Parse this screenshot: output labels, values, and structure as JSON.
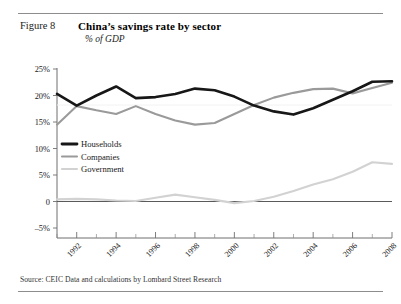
{
  "figure": {
    "label": "Figure 8",
    "title": "China’s savings rate by sector",
    "subtitle": "% of GDP",
    "source": "Source: CEIC Data and calculations by Lombard Street Research"
  },
  "colors": {
    "households": "#171717",
    "companies": "#9a9a9a",
    "government": "#d2d2d2",
    "axis": "#6f6f6f",
    "zero_line": "#5a5a5a",
    "rule": "#8d8d8d",
    "text": "#1a1a1a",
    "background": "#ffffff"
  },
  "chart_data": {
    "type": "line",
    "title": "China’s savings rate by sector",
    "subtitle": "% of GDP",
    "xlabel": "",
    "ylabel": "% of GDP",
    "ylim": [
      -5,
      25
    ],
    "xlim": [
      1991,
      2008
    ],
    "grid": false,
    "legend_position": "inside-left",
    "y_ticks": [
      25,
      20,
      15,
      10,
      5,
      0,
      -5
    ],
    "y_tick_labels": [
      "25%",
      "20%",
      "15%",
      "10%",
      "5%",
      "0",
      "–5%"
    ],
    "x_ticks": [
      1992,
      1994,
      1996,
      1998,
      2000,
      2002,
      2004,
      2006,
      2008
    ],
    "x_tick_labels": [
      "1992",
      "1994",
      "1996",
      "1998",
      "2000",
      "2002",
      "2004",
      "2006",
      "2008"
    ],
    "x_minor_ticks": [
      1991,
      1993,
      1995,
      1997,
      1999,
      2001,
      2003,
      2005,
      2007
    ],
    "x": [
      1991,
      1992,
      1993,
      1994,
      1995,
      1996,
      1997,
      1998,
      1999,
      2000,
      2001,
      2002,
      2003,
      2004,
      2005,
      2006,
      2007,
      2008
    ],
    "series": [
      {
        "name": "Households",
        "color": "#171717",
        "width": 2.6,
        "values": [
          20.3,
          18.1,
          20.0,
          21.7,
          19.5,
          19.7,
          20.3,
          21.3,
          21.0,
          19.8,
          18.1,
          17.0,
          16.4,
          17.6,
          19.2,
          20.8,
          22.6,
          22.7
        ]
      },
      {
        "name": "Companies",
        "color": "#9a9a9a",
        "width": 2.1,
        "values": [
          14.5,
          18.0,
          17.2,
          16.5,
          18.0,
          16.5,
          15.3,
          14.5,
          14.8,
          16.5,
          18.2,
          19.6,
          20.5,
          21.2,
          21.3,
          20.4,
          21.4,
          22.4
        ]
      },
      {
        "name": "Government",
        "color": "#d2d2d2",
        "width": 2.1,
        "values": [
          0.4,
          0.5,
          0.4,
          0.2,
          0.1,
          0.7,
          1.3,
          0.8,
          0.3,
          -0.3,
          0.1,
          0.9,
          2.0,
          3.2,
          4.2,
          5.6,
          7.4,
          7.1
        ]
      }
    ],
    "legend": [
      {
        "label": "Households",
        "color": "#171717"
      },
      {
        "label": "Companies",
        "color": "#9a9a9a"
      },
      {
        "label": "Government",
        "color": "#d2d2d2"
      }
    ]
  }
}
